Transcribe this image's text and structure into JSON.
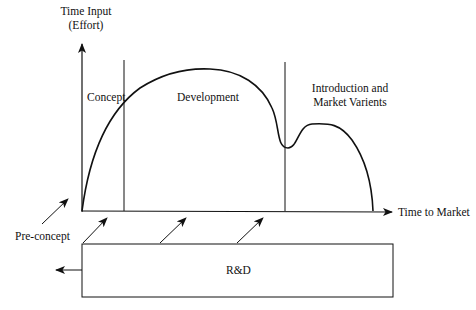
{
  "diagram": {
    "y_axis_label_line1": "Time Input",
    "y_axis_label_line2": "(Effort)",
    "x_axis_label": "Time to Market",
    "phases": [
      {
        "label": "Concept"
      },
      {
        "label": "Development"
      },
      {
        "label_line1": "Introduction and",
        "label_line2": "Market Varients"
      }
    ],
    "pre_concept_label": "Pre-concept",
    "rd_box_label": "R&D",
    "line_color": "#111111",
    "background": "#ffffff"
  }
}
